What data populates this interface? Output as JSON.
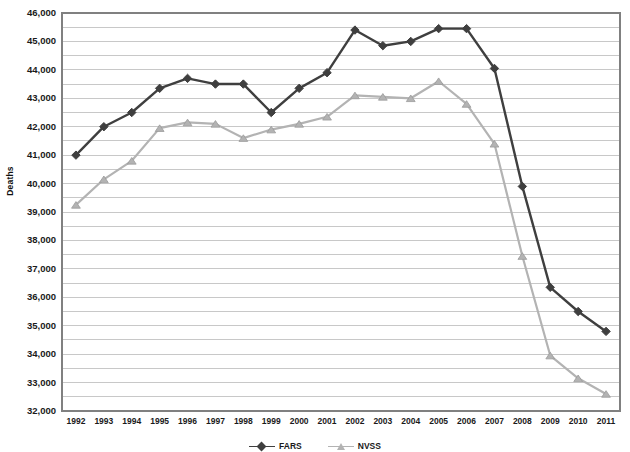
{
  "chart_data": {
    "type": "line",
    "title": "",
    "xlabel": "",
    "ylabel": "Deaths",
    "ylim": [
      32000,
      46000
    ],
    "ytick_step": 1000,
    "minor_gridline_step": 500,
    "grid": true,
    "legend_position": "bottom",
    "legend_clipped": true,
    "categories": [
      1992,
      1993,
      1994,
      1995,
      1996,
      1997,
      1998,
      1999,
      2000,
      2001,
      2002,
      2003,
      2004,
      2005,
      2006,
      2007,
      2008,
      2009,
      2010,
      2011
    ],
    "x_tick_labels": [
      "1992",
      "1993",
      "1994",
      "1995",
      "1996",
      "1997",
      "1998",
      "1999",
      "2000",
      "2001",
      "2002",
      "2003",
      "2004",
      "2005",
      "2006",
      "2007",
      "2008",
      "2009",
      "2010",
      "2011"
    ],
    "y_tick_labels": [
      "32,000",
      "33,000",
      "34,000",
      "35,000",
      "36,000",
      "37,000",
      "38,000",
      "39,000",
      "40,000",
      "41,000",
      "42,000",
      "43,000",
      "44,000",
      "45,000",
      "46,000"
    ],
    "series": [
      {
        "name": "FARS",
        "color": "#3f3f3f",
        "marker": "diamond",
        "values": [
          41000,
          42000,
          42500,
          43350,
          43700,
          43500,
          43500,
          42500,
          43350,
          43900,
          45400,
          44850,
          45000,
          45450,
          45450,
          44050,
          39900,
          36350,
          35500,
          34800
        ]
      },
      {
        "name": "NVSS",
        "color": "#b3b3b3",
        "marker": "triangle",
        "values": [
          39250,
          40150,
          40800,
          41950,
          42150,
          42100,
          41600,
          41900,
          42100,
          42350,
          43100,
          43050,
          43000,
          43600,
          42800,
          41400,
          37450,
          33950,
          33150,
          32600
        ]
      }
    ]
  },
  "axis": {
    "y_title": "Deaths"
  },
  "legend": {
    "entries": [
      {
        "label": "FARS",
        "marker": "diamond",
        "color": "#3f3f3f"
      },
      {
        "label": "NVSS",
        "marker": "triangle",
        "color": "#b3b3b3"
      }
    ]
  },
  "plot_geometry": {
    "left": 62,
    "right": 620,
    "top": 13,
    "bottom": 411
  },
  "colors": {
    "series_dark": "#3f3f3f",
    "series_light": "#b3b3b3",
    "gridline": "#c8c8c8",
    "border": "#808080",
    "text": "#1a1a1a",
    "background": "#ffffff"
  }
}
